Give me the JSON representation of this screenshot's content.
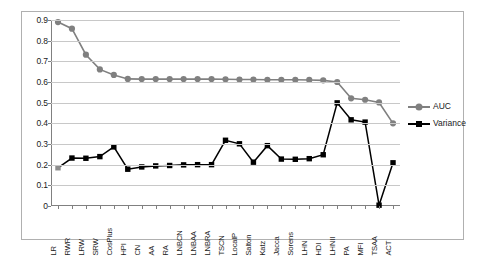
{
  "chart_data": {
    "type": "line",
    "title": "",
    "xlabel": "",
    "ylabel": "",
    "ylim": [
      0,
      0.9
    ],
    "yticks": [
      "0",
      "0.1",
      "0.2",
      "0.3",
      "0.4",
      "0.5",
      "0.6",
      "0.7",
      "0.8",
      "0.9"
    ],
    "ytick_values": [
      0,
      0.1,
      0.2,
      0.3,
      0.4,
      0.5,
      0.6,
      0.7,
      0.8,
      0.9
    ],
    "grid": true,
    "legend_position": "right",
    "categories": [
      "LR",
      "RWR",
      "LRW",
      "SRW",
      "CosPlus",
      "HPI",
      "CN",
      "AA",
      "RA",
      "LNBCN",
      "LNBAA",
      "LNBRA",
      "TSCN",
      "LocalP",
      "Salton",
      "Katz",
      "Jacca",
      "Sorens",
      "LHN",
      "HDI",
      "LHNII",
      "PA",
      "MFI",
      "TSAA",
      "ACT"
    ],
    "series": [
      {
        "name": "AUC",
        "color": "#808080",
        "marker": "circle",
        "values": [
          0.89,
          0.858,
          0.732,
          0.661,
          0.634,
          0.615,
          0.614,
          0.614,
          0.614,
          0.614,
          0.614,
          0.614,
          0.613,
          0.612,
          0.612,
          0.611,
          0.611,
          0.611,
          0.61,
          0.608,
          0.6,
          0.521,
          0.514,
          0.501,
          0.4
        ]
      },
      {
        "name": "Variance",
        "color": "#000000",
        "marker": "square",
        "values": [
          0.185,
          0.232,
          0.231,
          0.239,
          0.286,
          0.178,
          0.189,
          0.194,
          0.196,
          0.199,
          0.2,
          0.2,
          0.318,
          0.301,
          0.212,
          0.292,
          0.227,
          0.226,
          0.229,
          0.248,
          0.499,
          0.417,
          0.406,
          0.004,
          0.209
        ]
      }
    ]
  },
  "legend": {
    "entries": [
      {
        "label": "AUC"
      },
      {
        "label": "Variance"
      }
    ]
  },
  "colors": {
    "auc": "#808080",
    "variance": "#000000",
    "grid": "#c8c8c8",
    "axis": "#808080",
    "border": "#b0b0b0",
    "text": "#1a1a1a"
  }
}
